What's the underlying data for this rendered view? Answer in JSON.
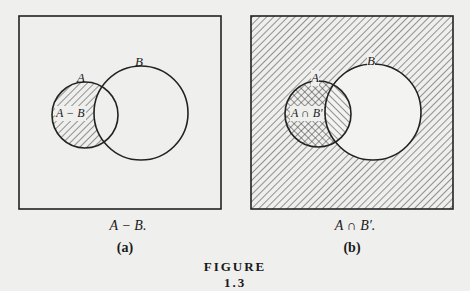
{
  "figure": {
    "title": "FIGURE 1.3",
    "panels": [
      {
        "id": "a",
        "set_labels": {
          "A": "A",
          "B": "B"
        },
        "region_label": "A − B",
        "caption": "A − B.",
        "sublabel": "(a)",
        "shaded_region": "A minus B"
      },
      {
        "id": "b",
        "set_labels": {
          "A": "A",
          "B": "B"
        },
        "region_label": "A ∩ B′",
        "caption": "A ∩ B′.",
        "sublabel": "(b)",
        "shaded_region": "A intersect complement of B (cross-hatched); complement of B hatched"
      }
    ]
  }
}
